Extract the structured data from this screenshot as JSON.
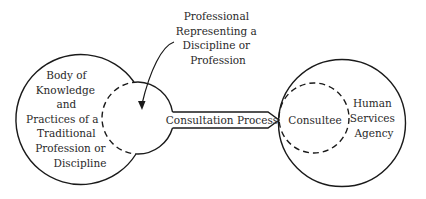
{
  "diagram": {
    "colors": {
      "stroke": "#1a1a1a",
      "text": "#2a2a2a",
      "background": "#ffffff"
    },
    "top_label": {
      "lines": [
        "Professional",
        "Representing a",
        "Discipline or",
        "Profession"
      ]
    },
    "left_circle": {
      "lines": [
        "Body of",
        "Knowledge",
        "and",
        "Practices of a",
        "Traditional",
        "Profession or",
        "Discipline"
      ]
    },
    "left_inner_circle": {
      "style": "dashed-left-solid-right"
    },
    "connector": {
      "label": "Consultation Process",
      "shape": "arrow-band"
    },
    "right_inner_circle": {
      "label": "Consultee",
      "style": "dashed"
    },
    "right_circle": {
      "lines": [
        "Human",
        "Services",
        "Agency"
      ]
    }
  }
}
